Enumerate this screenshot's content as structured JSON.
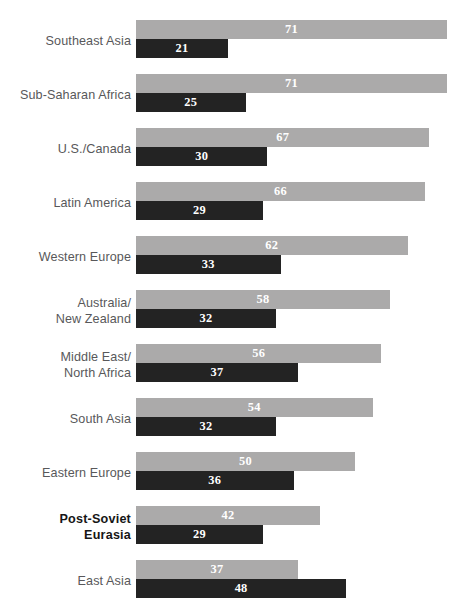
{
  "chart_data": {
    "type": "bar",
    "title": "",
    "subtitle": "",
    "xlabel": "",
    "ylabel": "",
    "orientation": "horizontal",
    "grouped": true,
    "grid": false,
    "legend": "none",
    "xlim": [
      0,
      71
    ],
    "categories": [
      "Southeast Asia",
      "Sub-Saharan Africa",
      "U.S./Canada",
      "Latin America",
      "Western Europe",
      "Australia/\nNew Zealand",
      "Middle East/\nNorth Africa",
      "South Asia",
      "Eastern Europe",
      "Post-Soviet\nEurasia",
      "East Asia"
    ],
    "series": [
      {
        "name": "series-a",
        "color": "#abaaaa",
        "values": [
          71,
          71,
          67,
          66,
          62,
          58,
          56,
          54,
          50,
          42,
          37
        ]
      },
      {
        "name": "series-b",
        "color": "#232323",
        "values": [
          21,
          25,
          30,
          29,
          33,
          32,
          37,
          32,
          36,
          29,
          48
        ]
      }
    ],
    "highlighted_category": "Post-Soviet\nEurasia",
    "colors": {
      "series_a": "#abaaaa",
      "series_b": "#232323",
      "label_text": "#58585a",
      "label_text_highlight": "#161616",
      "value_text": "#ffffff",
      "background": "#ffffff"
    }
  }
}
